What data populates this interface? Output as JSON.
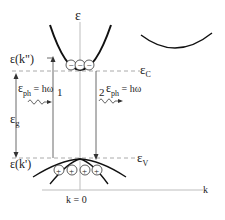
{
  "diagram": {
    "axis": {
      "energy_label": "ε",
      "k_label": "k",
      "k0_label": "k  = 0"
    },
    "levels": {
      "ec_label": "ε",
      "ec_sub": "C",
      "ev_label": "ε",
      "ev_sub": "V",
      "ek2_label": "ε(k\")",
      "ek1_label": "ε(k')",
      "eg_label": "ε",
      "eg_sub": "g"
    },
    "transitions": [
      {
        "number": "1",
        "label": "ε",
        "sub": "ph",
        "eq": " = hω"
      },
      {
        "number": "2",
        "label": "ε",
        "sub": "ph",
        "eq": " = hω"
      }
    ],
    "carriers": {
      "electrons": [
        "−",
        "−",
        "−"
      ],
      "holes": [
        "+",
        "+",
        "+",
        "+"
      ]
    },
    "colors": {
      "band": "#111111",
      "axis": "#bdbdbd",
      "dashed": "#aaaaaa"
    }
  }
}
